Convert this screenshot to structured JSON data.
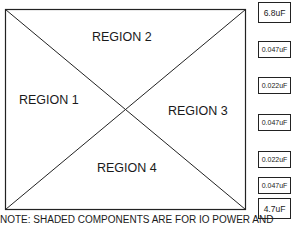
{
  "regions": [
    {
      "label": "REGION 1"
    },
    {
      "label": "REGION 2"
    },
    {
      "label": "REGION 3"
    },
    {
      "label": "REGION 4"
    }
  ],
  "capacitors": [
    {
      "value": "6.8uF"
    },
    {
      "value": "0.047uF"
    },
    {
      "value": "0.022uF"
    },
    {
      "value": "0.047uF"
    },
    {
      "value": "0.022uF"
    },
    {
      "value": "0.047uF"
    },
    {
      "value": "4.7uF"
    }
  ],
  "note": "NOTE:  SHADED COMPONENTS ARE FOR IO POWER AND"
}
